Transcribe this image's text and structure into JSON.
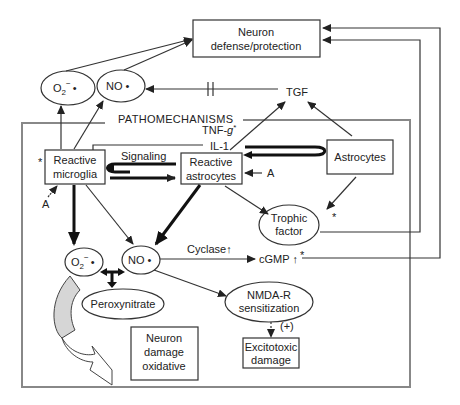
{
  "diagram": {
    "frame_title": "PATHOMECHANISMS",
    "nodes": {
      "neuron_defense": {
        "line1": "Neuron",
        "line2": "defense/protection"
      },
      "o2_top": {
        "label": "O",
        "sub": "2",
        "sup": "−",
        "dot": "•"
      },
      "no_top": {
        "label": "NO",
        "dot": "•"
      },
      "tgf": {
        "label": "TGF"
      },
      "tnf": {
        "label": "TNF-",
        "italic": "g",
        "star": "*"
      },
      "il1": {
        "label": "IL-1"
      },
      "reactive_microglia": {
        "line1": "Reactive",
        "line2": "microglia"
      },
      "reactive_astrocytes": {
        "line1": "Reactive",
        "line2": "astrocytes"
      },
      "astrocytes": {
        "label": "Astrocytes"
      },
      "signaling": {
        "label": "Signaling"
      },
      "trophic_factor": {
        "line1": "Trophic",
        "line2": "factor"
      },
      "o2_bottom": {
        "label": "O",
        "sub": "2",
        "sup": "−",
        "dot": "•"
      },
      "no_bottom": {
        "label": "NO",
        "dot": "•"
      },
      "cyclase": {
        "label": "Cyclase",
        "arrow": "↑"
      },
      "cgmp": {
        "label": "cGMP",
        "arrow": "↑"
      },
      "peroxynitrate": {
        "label": "Peroxynitrate"
      },
      "nmda": {
        "line1": "NMDA-R",
        "line2": "sensitization"
      },
      "excitotoxic": {
        "line1": "Excitotoxic",
        "line2": "damage"
      },
      "neuron_damage": {
        "line1": "Neuron",
        "line2": "damage",
        "line3": "oxidative"
      },
      "plus_label": {
        "label": "(+)"
      },
      "a_microglia": {
        "label": "A"
      },
      "a_astro": {
        "label": "A"
      },
      "star_microglia": {
        "label": "*"
      },
      "star_trophic": {
        "label": "*"
      },
      "star_cgmp": {
        "label": "*"
      }
    }
  }
}
